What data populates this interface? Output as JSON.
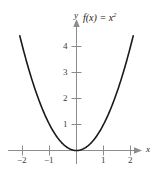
{
  "figure": {
    "background_color": "#ffffff",
    "curve_color": "#1a1a1a",
    "axis_color": "#8c8c8c",
    "text_color": "#2b2b2b"
  },
  "labels": {
    "function_label": "f(x) = x",
    "function_exponent": "2",
    "x_axis_name": "x",
    "y_axis_name": "y"
  },
  "chart_data": {
    "type": "line",
    "title": "",
    "subtitle": "",
    "xlabel": "x",
    "ylabel": "y",
    "annotations": [
      "f(x) = x²"
    ],
    "legend": [],
    "legend_position": "none",
    "grid": false,
    "xlim": [
      -2.45,
      2.45
    ],
    "ylim": [
      -0.35,
      4.85
    ],
    "xticks": [
      -2,
      -1,
      1,
      2
    ],
    "xticklabels": [
      "−2",
      "−1",
      "1",
      "2"
    ],
    "yticks": [
      1,
      2,
      3,
      4
    ],
    "yticklabels": [
      "1",
      "2",
      "3",
      "4"
    ],
    "series": [
      {
        "name": "f(x) = x²",
        "color": "#1a1a1a",
        "x": [
          -2.1,
          -1.9,
          -1.7,
          -1.5,
          -1.3,
          -1.1,
          -0.9,
          -0.7,
          -0.5,
          -0.3,
          -0.1,
          0,
          0.1,
          0.3,
          0.5,
          0.7,
          0.9,
          1.1,
          1.3,
          1.5,
          1.7,
          1.9,
          2.1
        ],
        "y": [
          4.41,
          3.61,
          2.89,
          2.25,
          1.69,
          1.21,
          0.81,
          0.49,
          0.25,
          0.09,
          0.01,
          0,
          0.01,
          0.09,
          0.25,
          0.49,
          0.81,
          1.21,
          1.69,
          2.25,
          2.89,
          3.61,
          4.41
        ]
      }
    ]
  }
}
